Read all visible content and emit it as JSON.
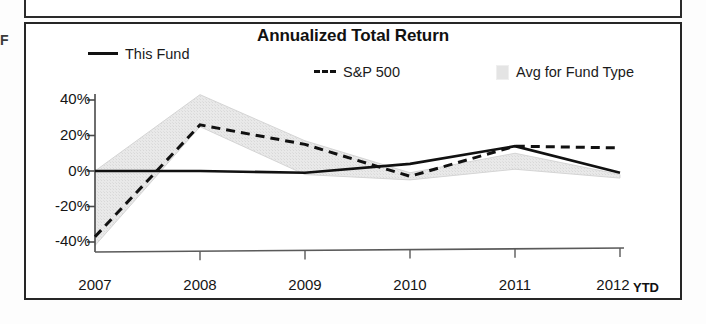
{
  "margin_glyph": "F",
  "chart": {
    "title": "Annualized Total Return",
    "legend": [
      {
        "label": "This Fund",
        "style": "solid-line",
        "color": "#111111"
      },
      {
        "label": "S&P 500",
        "style": "dashed-line",
        "color": "#111111"
      },
      {
        "label": "Avg for Fund Type",
        "style": "shaded-band",
        "color": "#e4e4e4"
      }
    ],
    "ytd_note": "YTD"
  },
  "chart_data": {
    "type": "line",
    "title": "Annualized Total Return",
    "xlabel": "",
    "ylabel": "",
    "x": [
      "2007",
      "2008",
      "2009",
      "2010",
      "2011",
      "2012"
    ],
    "xtick_labels": [
      "2007",
      "2008",
      "2009",
      "2010",
      "2011",
      "2012"
    ],
    "ytick_labels": [
      "40%",
      "20%",
      "0%",
      "-20%",
      "-40%"
    ],
    "ytick_values": [
      40,
      20,
      0,
      -20,
      -40
    ],
    "ylim": [
      -52,
      48
    ],
    "yunit": "percent",
    "grid": false,
    "legend_position": "top",
    "annotations": [
      "YTD"
    ],
    "series": [
      {
        "name": "This Fund",
        "style": "solid",
        "color": "#111111",
        "values": [
          0,
          0,
          -1,
          4,
          14,
          -1
        ]
      },
      {
        "name": "S&P 500",
        "style": "dashed",
        "color": "#111111",
        "values": [
          -37,
          26,
          15,
          -3,
          14,
          13
        ]
      },
      {
        "name": "Avg for Fund Type",
        "style": "band",
        "color": "#e4e4e4",
        "upper": [
          0,
          43,
          17,
          -1,
          10,
          -2
        ],
        "lower": [
          -42,
          25,
          -2,
          -5,
          1,
          -4
        ]
      }
    ]
  }
}
